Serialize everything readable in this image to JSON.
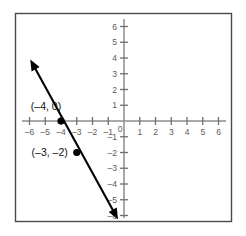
{
  "chart_data": {
    "type": "line",
    "title": "",
    "xlabel": "",
    "ylabel": "",
    "xlim": [
      -6.8,
      6.8
    ],
    "ylim": [
      -6.5,
      6.5
    ],
    "grid": false,
    "legend": null,
    "x_ticks": [
      -6,
      -5,
      -4,
      -3,
      -2,
      -1,
      0,
      1,
      2,
      3,
      4,
      5,
      6
    ],
    "y_ticks": [
      -6,
      -5,
      -4,
      -3,
      -2,
      -1,
      0,
      1,
      2,
      3,
      4,
      5,
      6
    ],
    "x_tick_labels": [
      "–6",
      "–5",
      "–4",
      "–3",
      "–2",
      "–1",
      "0",
      "1",
      "2",
      "3",
      "4",
      "5",
      "6"
    ],
    "y_tick_labels": [
      "–6",
      "–5",
      "–4",
      "–3",
      "–2",
      "–1",
      "0",
      "1",
      "2",
      "3",
      "4",
      "5",
      "6"
    ],
    "origin_label": "0",
    "series": [
      {
        "name": "line",
        "type": "line",
        "slope": -2,
        "y_intercept": -8,
        "equation": "y = -2x - 8",
        "arrows": "both",
        "endpoints": [
          {
            "x": -5.95,
            "y": 3.9
          },
          {
            "x": -0.38,
            "y": -6.25
          }
        ]
      }
    ],
    "points": [
      {
        "x": -4,
        "y": 0,
        "label": "(–4, 0)",
        "label_position": "above-left"
      },
      {
        "x": -3,
        "y": -2,
        "label": "(–3, –2)",
        "label_position": "left"
      }
    ],
    "colors": {
      "line": "#000000",
      "point": "#000000",
      "axis": "#8c8c8c",
      "tick": "#6f6f6f",
      "tick_label": "#5b5b5b",
      "point_label": "#111111",
      "frame": "#4a4a4a",
      "background": "#ffffff"
    }
  }
}
